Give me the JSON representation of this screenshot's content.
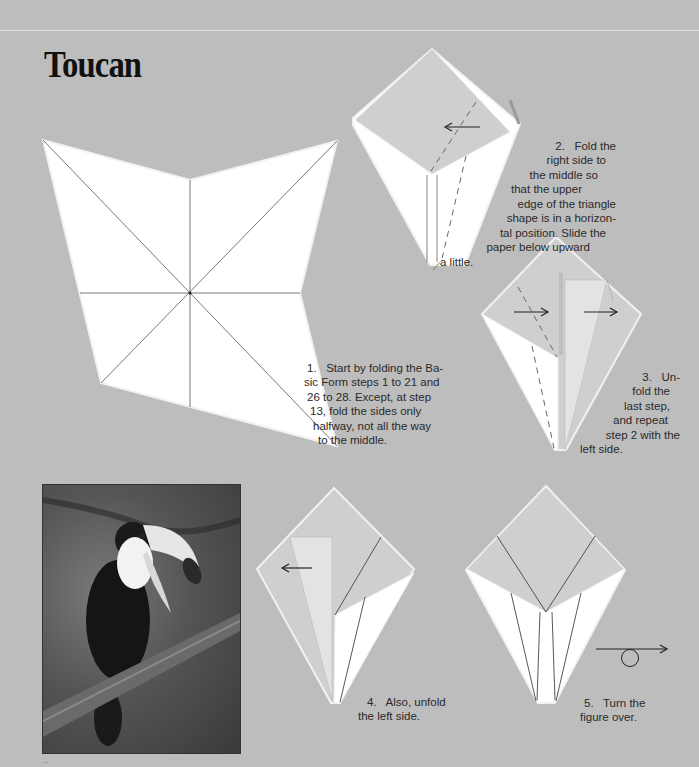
{
  "page": {
    "title": "Toucan",
    "page_number": "..."
  },
  "steps": [
    {
      "number": "1.",
      "lines": [
        "1.   Start by folding the Ba-",
        "sic Form steps 1 to 21 and",
        "26 to 28. Except, at step",
        "13, fold the sides only",
        "halfway, not all the way",
        "to the middle."
      ]
    },
    {
      "number": "2.",
      "lines": [
        "2.   Fold the",
        "right side to",
        "the middle so",
        "that the upper",
        "edge of the triangle",
        "shape is in a horizon-",
        "tal position. Slide the",
        "paper below upward",
        "a little."
      ]
    },
    {
      "number": "3.",
      "lines": [
        "3.   Un-",
        "fold the",
        "last step,",
        "and repeat",
        "step 2 with the",
        "left side."
      ]
    },
    {
      "number": "4.",
      "lines": [
        "4.   Also, unfold",
        "the left side."
      ]
    },
    {
      "number": "5.",
      "lines": [
        "5.   Turn the",
        "figure over."
      ]
    }
  ],
  "photo": {
    "subject": "toucan-on-branch-photo"
  },
  "colors": {
    "background": "#bdbdbd",
    "paper_white": "#ffffff",
    "paper_shaded": "#cfcfcf",
    "line": "#444444"
  }
}
